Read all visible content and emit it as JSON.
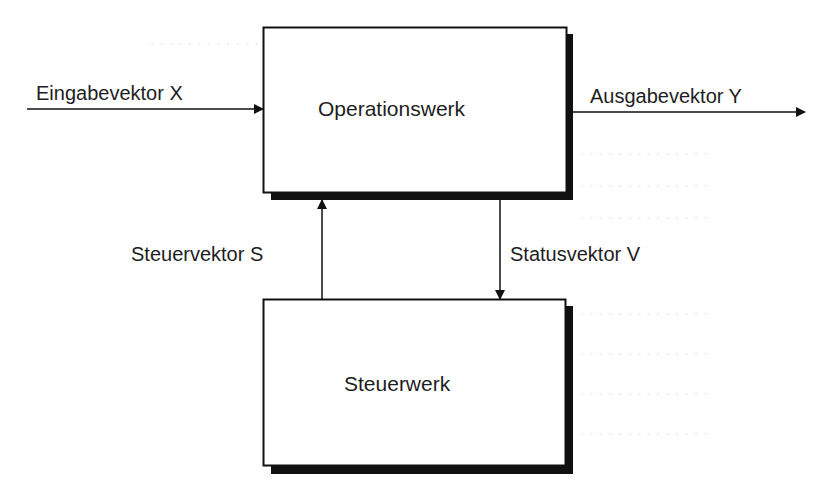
{
  "diagram": {
    "type": "block-diagram",
    "colors": {
      "stroke": "#111111",
      "shadow": "#111111",
      "text": "#1e1e1e",
      "background": "#ffffff"
    },
    "blocks": [
      {
        "id": "operationswerk",
        "label": "Operationswerk"
      },
      {
        "id": "steuerwerk",
        "label": "Steuerwerk"
      }
    ],
    "edges": [
      {
        "id": "input",
        "label": "Eingabevektor X",
        "from": "external",
        "to": "operationswerk"
      },
      {
        "id": "output",
        "label": "Ausgabevektor Y",
        "from": "operationswerk",
        "to": "external"
      },
      {
        "id": "control",
        "label": "Steuervektor S",
        "from": "steuerwerk",
        "to": "operationswerk"
      },
      {
        "id": "status",
        "label": "Statusvektor V",
        "from": "operationswerk",
        "to": "steuerwerk"
      }
    ]
  }
}
